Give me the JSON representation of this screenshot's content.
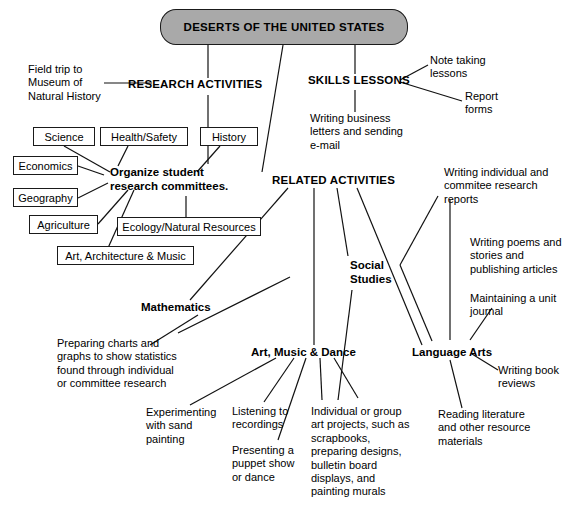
{
  "title": {
    "text": "DESERTS OF THE UNITED STATES"
  },
  "branches": {
    "research": {
      "label": "RESEARCH ACTIVITIES"
    },
    "skills": {
      "label": "SKILLS LESSONS"
    },
    "related": {
      "label": "RELATED ACTIVITIES"
    }
  },
  "research_activities": {
    "field_trip": "Field trip to\nMuseum of\nNatural History",
    "organize": "Organize student\nresearch committees.",
    "subject_boxes": [
      {
        "label": "Science"
      },
      {
        "label": "Health/Safety"
      },
      {
        "label": "History"
      },
      {
        "label": "Economics"
      },
      {
        "label": "Geography"
      },
      {
        "label": "Agriculture"
      },
      {
        "label": "Ecology/Natural Resources"
      },
      {
        "label": "Art, Architecture & Music"
      }
    ]
  },
  "skills_lessons": {
    "note_taking": "Note taking\nlessons",
    "report_forms": "Report\nforms",
    "writing_business": "Writing business\nletters and sending\ne-mail"
  },
  "related_activities": {
    "subjects": [
      {
        "label": "Mathematics"
      },
      {
        "label": "Social\nStudies"
      },
      {
        "label": "Art, Music & Dance"
      },
      {
        "label": "Language Arts"
      }
    ],
    "mathematics_items": [
      "Preparing charts and\ngraphs to show statistics\nfound through individual\nor committee research"
    ],
    "art_music_dance_items": [
      "Experimenting\nwith sand\npainting",
      "Listening to\nrecordings",
      "Presenting a\npuppet show\nor dance",
      "Individual or group\nart projects, such as\nscrapbooks,\npreparing designs,\nbulletin board\ndisplays, and\npainting murals"
    ],
    "language_arts_items": [
      "Writing individual and\ncommitee research\nreports",
      "Writing poems and\nstories and\npublishing articles",
      "Maintaining a unit\njournal",
      "Writing book\nreviews",
      "Reading literature\nand other resource\nmaterials"
    ]
  },
  "colors": {
    "title_fill": "#a9a9a9",
    "stroke": "#111111",
    "background": "#ffffff"
  }
}
